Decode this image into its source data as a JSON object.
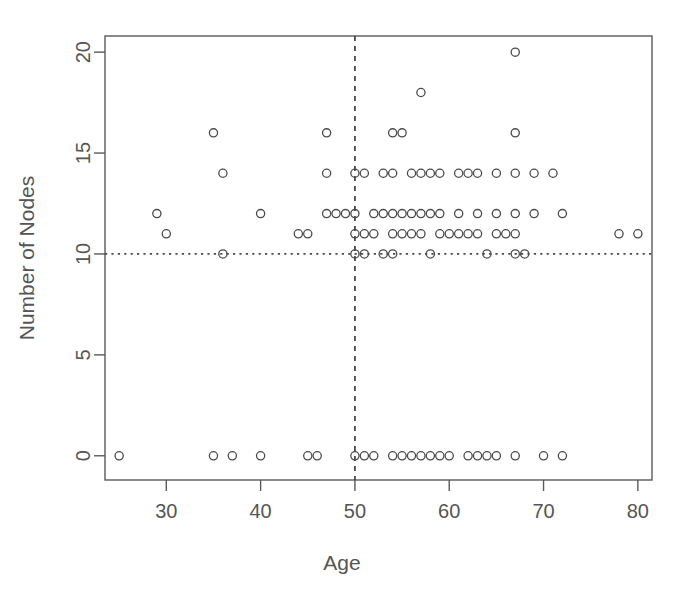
{
  "chart_data": {
    "type": "scatter",
    "title": "",
    "xlabel": "Age",
    "ylabel": "Number of Nodes",
    "xlim": [
      23.5,
      81.5
    ],
    "ylim": [
      -1.2,
      20.8
    ],
    "xticks": [
      30,
      40,
      50,
      60,
      70,
      80
    ],
    "yticks": [
      0,
      5,
      10,
      15,
      20
    ],
    "grid": false,
    "legend": null,
    "point_symbol": "open-circle",
    "point_color": "#4a4a4a",
    "reference_lines": [
      {
        "orientation": "vertical",
        "value": 50,
        "style": "dashed",
        "color": "#4a4a4a"
      },
      {
        "orientation": "horizontal",
        "value": 10,
        "style": "dotted",
        "color": "#4a4a4a"
      }
    ],
    "x": [
      25,
      35,
      37,
      40,
      45,
      46,
      50,
      50,
      51,
      52,
      54,
      55,
      56,
      57,
      58,
      59,
      61,
      62,
      63,
      65,
      67,
      70,
      72,
      29,
      30,
      36,
      44,
      45,
      47,
      48,
      49,
      50,
      50,
      51,
      52,
      53,
      54,
      55,
      56,
      57,
      58,
      59,
      60,
      61,
      62,
      63,
      65,
      67,
      70,
      72,
      78,
      80,
      40,
      47,
      48,
      50,
      52,
      53,
      54,
      55,
      56,
      57,
      58,
      59,
      61,
      62,
      63,
      65,
      67,
      69,
      72,
      35,
      46,
      50,
      51,
      53,
      54,
      56,
      57,
      58,
      60,
      61,
      63,
      64,
      65,
      67,
      69,
      71,
      36,
      47,
      50,
      54,
      55,
      67,
      57,
      67
    ],
    "y": [
      0,
      0,
      0,
      0,
      0,
      0,
      0,
      0,
      0,
      0,
      0,
      0,
      0,
      0,
      0,
      0,
      0,
      0,
      0,
      0,
      0,
      0,
      0,
      12,
      11,
      10,
      11,
      11,
      11,
      10,
      10,
      10,
      10,
      10,
      10,
      11,
      10,
      11,
      11,
      11,
      11,
      11,
      10,
      11,
      11,
      11,
      11,
      10,
      10,
      11,
      11,
      11,
      12,
      12,
      12,
      12,
      12,
      12,
      12,
      12,
      12,
      12,
      12,
      12,
      12,
      12,
      12,
      12,
      12,
      12,
      12,
      16,
      14,
      14,
      14,
      14,
      14,
      14,
      14,
      14,
      14,
      14,
      14,
      14,
      14,
      14,
      14,
      14,
      14,
      16,
      14,
      16,
      16,
      16,
      18,
      20
    ],
    "points": [
      {
        "x": 25,
        "y": 0
      },
      {
        "x": 35,
        "y": 0
      },
      {
        "x": 37,
        "y": 0
      },
      {
        "x": 40,
        "y": 0
      },
      {
        "x": 45,
        "y": 0
      },
      {
        "x": 46,
        "y": 0
      },
      {
        "x": 50,
        "y": 0
      },
      {
        "x": 51,
        "y": 0
      },
      {
        "x": 52,
        "y": 0
      },
      {
        "x": 54,
        "y": 0
      },
      {
        "x": 55,
        "y": 0
      },
      {
        "x": 56,
        "y": 0
      },
      {
        "x": 57,
        "y": 0
      },
      {
        "x": 58,
        "y": 0
      },
      {
        "x": 59,
        "y": 0
      },
      {
        "x": 60,
        "y": 0
      },
      {
        "x": 62,
        "y": 0
      },
      {
        "x": 63,
        "y": 0
      },
      {
        "x": 64,
        "y": 0
      },
      {
        "x": 65,
        "y": 0
      },
      {
        "x": 67,
        "y": 0
      },
      {
        "x": 70,
        "y": 0
      },
      {
        "x": 72,
        "y": 0
      },
      {
        "x": 29,
        "y": 12
      },
      {
        "x": 30,
        "y": 11
      },
      {
        "x": 36,
        "y": 10
      },
      {
        "x": 44,
        "y": 11
      },
      {
        "x": 45,
        "y": 11
      },
      {
        "x": 48,
        "y": 12
      },
      {
        "x": 49,
        "y": 12
      },
      {
        "x": 50,
        "y": 10
      },
      {
        "x": 51,
        "y": 10
      },
      {
        "x": 50,
        "y": 11
      },
      {
        "x": 51,
        "y": 11
      },
      {
        "x": 52,
        "y": 11
      },
      {
        "x": 53,
        "y": 10
      },
      {
        "x": 54,
        "y": 10
      },
      {
        "x": 54,
        "y": 11
      },
      {
        "x": 55,
        "y": 11
      },
      {
        "x": 56,
        "y": 11
      },
      {
        "x": 57,
        "y": 11
      },
      {
        "x": 58,
        "y": 10
      },
      {
        "x": 59,
        "y": 11
      },
      {
        "x": 60,
        "y": 11
      },
      {
        "x": 61,
        "y": 11
      },
      {
        "x": 62,
        "y": 11
      },
      {
        "x": 63,
        "y": 11
      },
      {
        "x": 64,
        "y": 10
      },
      {
        "x": 65,
        "y": 11
      },
      {
        "x": 66,
        "y": 11
      },
      {
        "x": 67,
        "y": 10
      },
      {
        "x": 68,
        "y": 10
      },
      {
        "x": 67,
        "y": 11
      },
      {
        "x": 78,
        "y": 11
      },
      {
        "x": 80,
        "y": 11
      },
      {
        "x": 40,
        "y": 12
      },
      {
        "x": 47,
        "y": 12
      },
      {
        "x": 50,
        "y": 12
      },
      {
        "x": 52,
        "y": 12
      },
      {
        "x": 53,
        "y": 12
      },
      {
        "x": 54,
        "y": 12
      },
      {
        "x": 55,
        "y": 12
      },
      {
        "x": 56,
        "y": 12
      },
      {
        "x": 57,
        "y": 12
      },
      {
        "x": 58,
        "y": 12
      },
      {
        "x": 59,
        "y": 12
      },
      {
        "x": 61,
        "y": 12
      },
      {
        "x": 63,
        "y": 12
      },
      {
        "x": 65,
        "y": 12
      },
      {
        "x": 67,
        "y": 12
      },
      {
        "x": 69,
        "y": 12
      },
      {
        "x": 72,
        "y": 12
      },
      {
        "x": 36,
        "y": 14
      },
      {
        "x": 47,
        "y": 14
      },
      {
        "x": 50,
        "y": 14
      },
      {
        "x": 51,
        "y": 14
      },
      {
        "x": 53,
        "y": 14
      },
      {
        "x": 54,
        "y": 14
      },
      {
        "x": 56,
        "y": 14
      },
      {
        "x": 57,
        "y": 14
      },
      {
        "x": 58,
        "y": 14
      },
      {
        "x": 59,
        "y": 14
      },
      {
        "x": 61,
        "y": 14
      },
      {
        "x": 62,
        "y": 14
      },
      {
        "x": 63,
        "y": 14
      },
      {
        "x": 65,
        "y": 14
      },
      {
        "x": 67,
        "y": 14
      },
      {
        "x": 69,
        "y": 14
      },
      {
        "x": 71,
        "y": 14
      },
      {
        "x": 35,
        "y": 16
      },
      {
        "x": 47,
        "y": 16
      },
      {
        "x": 54,
        "y": 16
      },
      {
        "x": 55,
        "y": 16
      },
      {
        "x": 67,
        "y": 16
      },
      {
        "x": 57,
        "y": 18
      },
      {
        "x": 67,
        "y": 20
      }
    ]
  },
  "labels": {
    "x_axis_title": "Age",
    "y_axis_title": "Number of Nodes",
    "x_tick_labels": [
      "30",
      "40",
      "50",
      "60",
      "70",
      "80"
    ],
    "y_tick_labels": [
      "0",
      "5",
      "10",
      "15",
      "20"
    ]
  }
}
